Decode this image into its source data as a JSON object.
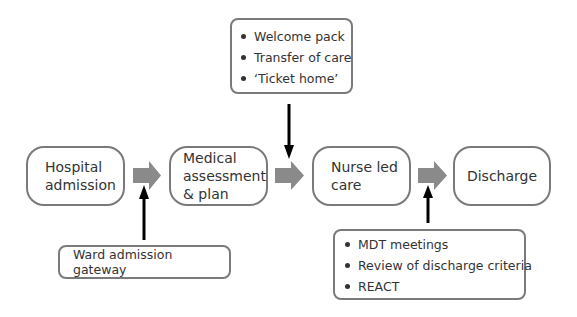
{
  "diagram": {
    "flow_steps": [
      {
        "id": "hospital-admission",
        "label": "Hospital admission",
        "lines": [
          "Hospital",
          "admission"
        ]
      },
      {
        "id": "medical-assessment",
        "label": "Medical assessment & plan",
        "lines": [
          "Medical",
          "assessment",
          "& plan"
        ]
      },
      {
        "id": "nurse-led-care",
        "label": "Nurse led care",
        "lines": [
          "Nurse led",
          "care"
        ]
      },
      {
        "id": "discharge",
        "label": "Discharge",
        "lines": [
          "Discharge"
        ]
      }
    ],
    "inputs": {
      "ward_gateway": {
        "label": "Ward admission gateway",
        "points_to": "between hospital-admission and medical-assessment"
      },
      "transfer_box": {
        "items": [
          "Welcome pack",
          "Transfer of care",
          "‘Ticket home’"
        ],
        "points_to": "between medical-assessment and nurse-led-care"
      },
      "discharge_box": {
        "items": [
          "MDT meetings",
          "Review of discharge criteria",
          "REACT"
        ],
        "points_to": "between nurse-led-care and discharge"
      }
    },
    "colors": {
      "box_border": "#7a7a7a",
      "flow_arrow": "#8a8a8a",
      "input_arrow": "#000000",
      "text": "#333333"
    }
  }
}
